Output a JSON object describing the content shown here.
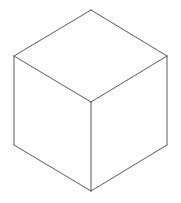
{
  "canvas": {
    "width": 181,
    "height": 203,
    "background_color": "#ffffff",
    "title": "Cube"
  },
  "figure": {
    "name": "isometric-cube",
    "stroke_color": "#5a5a5a",
    "stroke_width": 1,
    "fill_color": "#ffffff",
    "vertices": {
      "top": {
        "x": 91,
        "y": 10
      },
      "left_upper": {
        "x": 14,
        "y": 56
      },
      "right_upper": {
        "x": 167,
        "y": 56
      },
      "center": {
        "x": 91,
        "y": 102
      },
      "left_lower": {
        "x": 14,
        "y": 145
      },
      "right_lower": {
        "x": 167,
        "y": 145
      },
      "bottom": {
        "x": 91,
        "y": 191
      }
    },
    "faces": {
      "top_face": "91,10 167,56 91,102 14,56",
      "left_face": "14,56 91,102 91,191 14,145",
      "right_face": "91,102 167,56 167,145 91,191"
    },
    "edges": [
      {
        "name": "top-to-left-upper",
        "path": "M 91 10 L 14 56"
      },
      {
        "name": "top-to-right-upper",
        "path": "M 91 10 L 167 56"
      },
      {
        "name": "left-upper-to-center",
        "path": "M 14 56 L 91 102"
      },
      {
        "name": "right-upper-to-center",
        "path": "M 167 56 L 91 102"
      },
      {
        "name": "left-vertical",
        "path": "M 14 56 L 14 145"
      },
      {
        "name": "right-vertical",
        "path": "M 167 56 L 167 145"
      },
      {
        "name": "center-vertical",
        "path": "M 91 102 L 91 191"
      },
      {
        "name": "left-lower-to-bottom",
        "path": "M 14 145 L 91 191"
      },
      {
        "name": "right-lower-to-bottom",
        "path": "M 167 145 L 91 191"
      }
    ]
  }
}
